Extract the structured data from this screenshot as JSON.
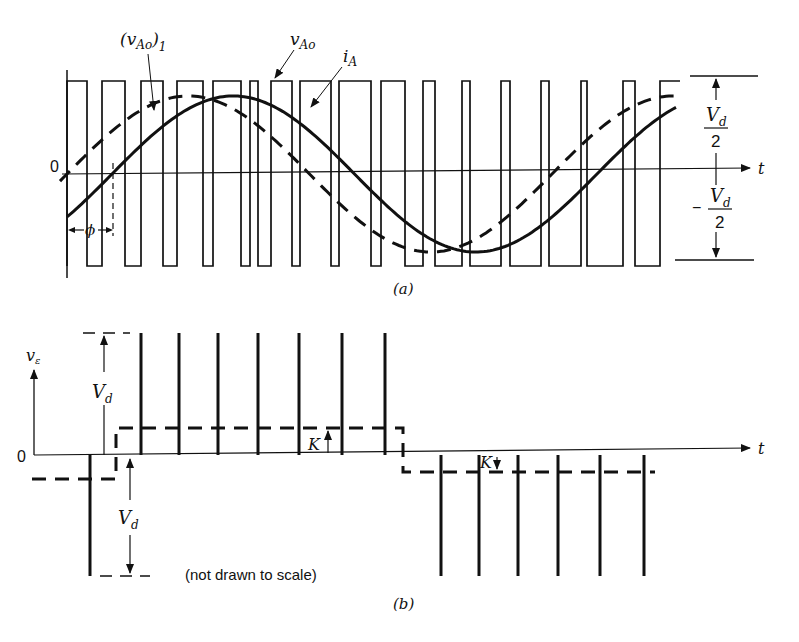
{
  "figure": {
    "panel_a": {
      "caption": "(a)",
      "labels": {
        "fundamental": "(v",
        "fundamental_sub": "Ao",
        "fundamental_close": ")",
        "fundamental_index": "1",
        "output_voltage": "v",
        "output_voltage_sub": "Ao",
        "current": "i",
        "current_sub": "A",
        "origin": "0",
        "time_axis": "t",
        "pos_level_num": "V",
        "pos_level_sub": "d",
        "pos_level_den": "2",
        "neg_level_sign": "−",
        "neg_level_num": "V",
        "neg_level_sub": "d",
        "neg_level_den": "2",
        "phase": "ϕ"
      },
      "pwm_edges_x": [
        67,
        87,
        102,
        125,
        141,
        163,
        177,
        203,
        213,
        241,
        250,
        258,
        271,
        292,
        300,
        331,
        339,
        371,
        381,
        405,
        423,
        435,
        462,
        470,
        501,
        510,
        541,
        549,
        581,
        587,
        623,
        635,
        660,
        680
      ],
      "levels": {
        "top_y": 81,
        "bottom_y": 266,
        "zero_y": 174
      },
      "sine_fundamental": {
        "amplitude_px": 78,
        "x_start": 60,
        "x_end": 683,
        "zero_cross_x": 67,
        "period_px": 485
      },
      "sine_current": {
        "amplitude_px": 78,
        "x_start": 67,
        "x_end": 676,
        "zero_cross_x": 112,
        "period_px": 485
      }
    },
    "panel_b": {
      "caption": "(b)",
      "labels": {
        "y_axis": "v",
        "y_axis_sub": "ε",
        "origin": "0",
        "time_axis": "t",
        "vd_upper": "V",
        "vd_upper_sub": "d",
        "vd_lower": "V",
        "vd_lower_sub": "d",
        "k_upper": "K",
        "k_lower": "K",
        "note": "(not drawn to scale)"
      },
      "zero_y": 455,
      "top_y": 333,
      "bottom_y": 576,
      "k_upper_y": 428,
      "k_lower_y": 472,
      "initial_dash_y": 479,
      "step_up_x": 116,
      "step_down_x": 403,
      "positive_spikes_x": [
        141,
        179,
        218,
        258,
        299,
        342,
        385
      ],
      "negative_spikes_x": [
        90,
        441,
        479,
        518,
        558,
        600,
        644
      ]
    }
  }
}
